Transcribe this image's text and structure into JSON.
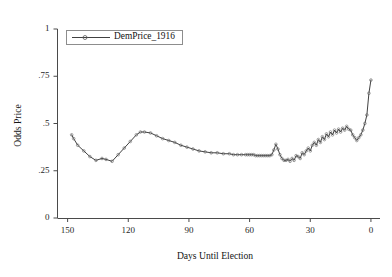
{
  "title": "Presidential Odds Market for 1916 Election",
  "legend": {
    "label": "DemPrice_1916",
    "marker_icon": "line-circle-marker-icon",
    "position": "upper-left-inside"
  },
  "axes": {
    "y_title": "Odds Price",
    "x_title": "Days Until Election",
    "y_ticks": [
      "0",
      ".25",
      ".5",
      ".75",
      "1"
    ],
    "x_ticks": [
      "150",
      "120",
      "90",
      "60",
      "30",
      "0"
    ]
  },
  "style": {
    "line_color": "#2b2b2b",
    "marker_color": "#555555",
    "axis_color": "#4a4a4a",
    "background": "#ffffff",
    "legend_border": "#8d8d8d"
  },
  "chart_data": {
    "type": "line",
    "title": "Presidential Odds Market for 1916 Election",
    "xlabel": "Days Until Election",
    "ylabel": "Odds Price",
    "xlim": [
      155,
      -3
    ],
    "ylim": [
      0,
      1
    ],
    "x_reversed": true,
    "grid": false,
    "legend_position": "upper-left-inside",
    "markers": "open-circle",
    "series": [
      {
        "name": "DemPrice_1916",
        "x": [
          148,
          147,
          145,
          142,
          139,
          136,
          133,
          131,
          128,
          125,
          122,
          119,
          116,
          114,
          112,
          109,
          106,
          103,
          100,
          97,
          94,
          91,
          88,
          85,
          82,
          79,
          76,
          73,
          70,
          68,
          66,
          64,
          62,
          61,
          60,
          59,
          58,
          57,
          56,
          55,
          54,
          53,
          52,
          51,
          50,
          49,
          48,
          47,
          46,
          45,
          44,
          43,
          42,
          41,
          40,
          39,
          38,
          37,
          36,
          35,
          34,
          33,
          32,
          31,
          30,
          29,
          28,
          27,
          26,
          25,
          24,
          23,
          22,
          21,
          20,
          19,
          18,
          17,
          16,
          15,
          14,
          13,
          12,
          11,
          10,
          9,
          8,
          7,
          6,
          5,
          4,
          3,
          2,
          1,
          0
        ],
        "y": [
          0.44,
          0.42,
          0.385,
          0.355,
          0.325,
          0.305,
          0.315,
          0.31,
          0.3,
          0.335,
          0.37,
          0.405,
          0.44,
          0.455,
          0.455,
          0.45,
          0.435,
          0.42,
          0.41,
          0.4,
          0.385,
          0.375,
          0.365,
          0.355,
          0.35,
          0.345,
          0.345,
          0.34,
          0.34,
          0.335,
          0.335,
          0.335,
          0.335,
          0.335,
          0.335,
          0.335,
          0.335,
          0.33,
          0.33,
          0.33,
          0.33,
          0.33,
          0.33,
          0.33,
          0.33,
          0.335,
          0.36,
          0.39,
          0.365,
          0.335,
          0.315,
          0.305,
          0.305,
          0.31,
          0.3,
          0.315,
          0.305,
          0.33,
          0.325,
          0.315,
          0.345,
          0.335,
          0.355,
          0.37,
          0.355,
          0.385,
          0.4,
          0.385,
          0.415,
          0.4,
          0.43,
          0.415,
          0.445,
          0.43,
          0.455,
          0.44,
          0.465,
          0.45,
          0.47,
          0.455,
          0.475,
          0.465,
          0.485,
          0.47,
          0.465,
          0.44,
          0.425,
          0.41,
          0.425,
          0.44,
          0.465,
          0.5,
          0.545,
          0.66,
          0.73
        ]
      }
    ]
  }
}
